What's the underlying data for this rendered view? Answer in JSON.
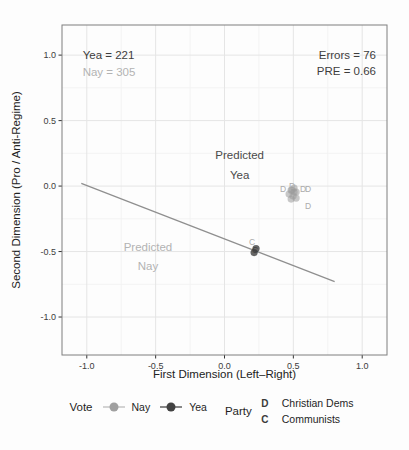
{
  "chart_data": {
    "type": "scatter",
    "title": "",
    "xlabel": "First Dimension (Left–Right)",
    "ylabel": "Second Dimension (Pro / Anti-Regime)",
    "xlim": [
      -1.18,
      1.18
    ],
    "ylim": [
      -1.29,
      1.23
    ],
    "grid": true,
    "x_ticks": {
      "values": [
        -1.0,
        -0.5,
        0.0,
        0.5,
        1.0
      ],
      "labels": [
        "-1.0",
        "-0.5",
        "0.0",
        "0.5",
        "1.0"
      ]
    },
    "y_ticks": {
      "values": [
        -1.0,
        -0.5,
        0.0,
        0.5,
        1.0
      ],
      "labels": [
        "-1.0",
        "-0.5",
        "0.0",
        "0.5",
        "1.0"
      ]
    },
    "grid_minor_ticks": [
      -0.75,
      -0.25,
      0.25,
      0.75
    ],
    "colors": {
      "yea": "#424242",
      "nay": "#a4a4a4",
      "grid_major": "#e5e5e5",
      "grid_minor": "#f3f3f3",
      "panel_border": "#7f7f7f",
      "axis_text": "#3c3c3c",
      "tick": "#333333"
    },
    "stats": {
      "yea": 221,
      "nay": 305,
      "errors": 76,
      "pre": 0.66
    },
    "cutting_line": {
      "x1": -1.04,
      "y1": 0.02,
      "x2": 0.8,
      "y2": -0.73,
      "color": "#8f8f8f"
    },
    "series": [
      {
        "name": "Nay",
        "party": "Christian Dems",
        "color": "#9b9b9b",
        "opacity": 0.55,
        "points": [
          [
            0.484,
            -0.031
          ],
          [
            0.505,
            -0.015
          ],
          [
            0.52,
            -0.046
          ],
          [
            0.469,
            -0.061
          ],
          [
            0.498,
            -0.076
          ],
          [
            0.52,
            -0.092
          ],
          [
            0.484,
            -0.099
          ],
          [
            0.505,
            -0.046
          ],
          [
            0.49,
            -0.03
          ]
        ]
      },
      {
        "name": "Yea",
        "party": "Communists",
        "color": "#3f3f3f",
        "opacity": 0.8,
        "points": [
          [
            0.229,
            -0.477
          ],
          [
            0.215,
            -0.508
          ]
        ]
      }
    ],
    "point_labels": [
      {
        "text": "D",
        "x": 0.425,
        "y": -0.023,
        "color": "#ababab"
      },
      {
        "text": "D",
        "x": 0.49,
        "y": 0.0,
        "color": "#ababab"
      },
      {
        "text": "D",
        "x": 0.571,
        "y": -0.023,
        "color": "#ababab"
      },
      {
        "text": "D",
        "x": 0.607,
        "y": -0.023,
        "color": "#ababab"
      },
      {
        "text": "D",
        "x": 0.607,
        "y": -0.153,
        "color": "#ababab"
      },
      {
        "text": "C",
        "x": 0.2,
        "y": -0.427,
        "color": "#ababab"
      },
      {
        "text": "C",
        "x": 0.222,
        "y": -0.489,
        "color": "#3f3f3f"
      }
    ],
    "annotations": [
      {
        "text": "Yea = 221",
        "x": -1.03,
        "y": 1.0,
        "anchor": "start",
        "color": "#3d3d3d"
      },
      {
        "text": "Nay = 305",
        "x": -1.03,
        "y": 0.87,
        "anchor": "start",
        "color": "#b3b3b3"
      },
      {
        "text": "Errors = 76",
        "x": 1.1,
        "y": 1.0,
        "anchor": "end",
        "color": "#3d3d3d"
      },
      {
        "text": "PRE = 0.66",
        "x": 1.1,
        "y": 0.878,
        "anchor": "end",
        "color": "#3d3d3d"
      },
      {
        "text": "Predicted",
        "x": 0.11,
        "y": 0.237,
        "anchor": "middle",
        "color": "#4a4a4a"
      },
      {
        "text": "Yea",
        "x": 0.11,
        "y": 0.084,
        "anchor": "middle",
        "color": "#4a4a4a"
      },
      {
        "text": "Predicted",
        "x": -0.556,
        "y": -0.466,
        "anchor": "middle",
        "color": "#b3b3b3"
      },
      {
        "text": "Nay",
        "x": -0.556,
        "y": -0.611,
        "anchor": "middle",
        "color": "#b3b3b3"
      }
    ]
  },
  "legend": {
    "vote": {
      "title": "Vote",
      "items": [
        {
          "label": "Nay",
          "point_color": "#a0a0a0",
          "line_color": "#bdbdbd"
        },
        {
          "label": "Yea",
          "point_color": "#424242",
          "line_color": "#4a4a4a"
        }
      ]
    },
    "party": {
      "title": "Party",
      "key_color": "#3a3a3a",
      "items": [
        {
          "key": "D",
          "label": "Christian Dems"
        },
        {
          "key": "C",
          "label": "Communists"
        }
      ]
    }
  }
}
